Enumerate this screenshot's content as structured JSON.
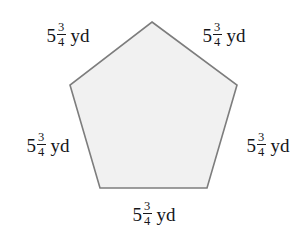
{
  "figure": {
    "shape_name": "regular-pentagon",
    "fill_color": "#f1f1f1",
    "stroke_color": "#7d7d7d",
    "background_color": "#ffffff",
    "text_color": "#16161a",
    "vertices": [
      {
        "name": "apex",
        "x": 152,
        "y": 22
      },
      {
        "name": "upper-right",
        "x": 237,
        "y": 85
      },
      {
        "name": "lower-right",
        "x": 207,
        "y": 188
      },
      {
        "name": "lower-left",
        "x": 100,
        "y": 188
      },
      {
        "name": "upper-left",
        "x": 70,
        "y": 85
      }
    ]
  },
  "labels": {
    "top_left": {
      "whole": "5",
      "numerator": "3",
      "denominator": "4",
      "unit": "yd"
    },
    "top_right": {
      "whole": "5",
      "numerator": "3",
      "denominator": "4",
      "unit": "yd"
    },
    "left": {
      "whole": "5",
      "numerator": "3",
      "denominator": "4",
      "unit": "yd"
    },
    "right": {
      "whole": "5",
      "numerator": "3",
      "denominator": "4",
      "unit": "yd"
    },
    "bottom": {
      "whole": "5",
      "numerator": "3",
      "denominator": "4",
      "unit": "yd"
    }
  }
}
